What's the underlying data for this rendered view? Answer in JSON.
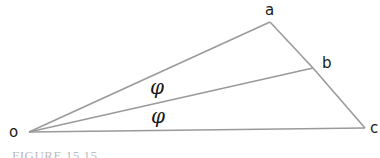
{
  "diagram": {
    "type": "geometry",
    "vertices": {
      "o": {
        "label": "o",
        "x": 29,
        "y": 132
      },
      "a": {
        "label": "a",
        "x": 270,
        "y": 22
      },
      "b": {
        "label": "b",
        "x": 313,
        "y": 68
      },
      "c": {
        "label": "c",
        "x": 365,
        "y": 128
      }
    },
    "edges": [
      [
        "o",
        "a"
      ],
      [
        "o",
        "b"
      ],
      [
        "o",
        "c"
      ],
      [
        "a",
        "b"
      ],
      [
        "b",
        "c"
      ]
    ],
    "angle_labels": [
      {
        "text": "φ",
        "between": [
          "oa",
          "ob"
        ]
      },
      {
        "text": "φ",
        "between": [
          "ob",
          "oc"
        ]
      }
    ],
    "colors": {
      "line": "#9a9a9a",
      "label": "#1a1a1a",
      "caption": "#bdbdbd"
    }
  },
  "caption": "FIGURE 15.15"
}
